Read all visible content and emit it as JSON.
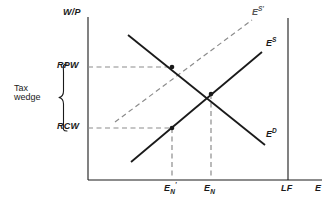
{
  "figure": {
    "type": "economics-diagram",
    "background_color": "#ffffff",
    "line_color": "#1a1a1a",
    "dashed_color": "#8c8c8c"
  },
  "axes": {
    "y_axis_label": "W/P",
    "x_axis_label": "E",
    "origin": {
      "x": 88,
      "y": 180
    },
    "y_top": 17,
    "x_right": 322
  },
  "y_ticks": [
    {
      "label": "RPW",
      "y": 67
    },
    {
      "label": "RCW",
      "y": 128
    }
  ],
  "x_ticks": [
    {
      "label": "E",
      "sub": "N",
      "sup": "'",
      "x": 172
    },
    {
      "label": "E",
      "sub": "N",
      "sup": "",
      "x": 211
    },
    {
      "label": "LF",
      "sub": "",
      "sup": "",
      "x": 288
    }
  ],
  "curves": [
    {
      "name": "labour-demand",
      "label": "E",
      "superscript": "D",
      "style": "solid",
      "x1": 128,
      "y1": 35,
      "x2": 265,
      "y2": 145,
      "label_x": 266,
      "label_y": 135
    },
    {
      "name": "labour-supply",
      "label": "E",
      "superscript": "S",
      "style": "solid",
      "x1": 131,
      "y1": 162,
      "x2": 262,
      "y2": 52,
      "label_x": 266,
      "label_y": 43
    },
    {
      "name": "labour-supply-shifted",
      "label": "E",
      "superscript": "S'",
      "style": "dashed",
      "x1": 115,
      "y1": 122,
      "x2": 252,
      "y2": 20,
      "label_x": 252,
      "label_y": 12
    }
  ],
  "points": [
    {
      "name": "equilibrium-with-tax",
      "x": 172,
      "y": 67
    },
    {
      "name": "equilibrium-no-tax",
      "x": 211,
      "y": 94
    },
    {
      "name": "cost-of-worker",
      "x": 172,
      "y": 128
    }
  ],
  "guides": [
    {
      "name": "rpw-horizontal",
      "orientation": "horizontal",
      "x1": 88,
      "y1": 67,
      "x2": 172,
      "y2": 67
    },
    {
      "name": "rcw-horizontal",
      "orientation": "horizontal",
      "x1": 88,
      "y1": 128,
      "x2": 172,
      "y2": 128
    },
    {
      "name": "en-prime-vertical",
      "orientation": "vertical",
      "x1": 172,
      "y1": 128,
      "x2": 172,
      "y2": 180
    },
    {
      "name": "en-vertical",
      "orientation": "vertical",
      "x1": 211,
      "y1": 94,
      "x2": 211,
      "y2": 180
    }
  ],
  "full_employment_line": {
    "name": "LF",
    "x": 288,
    "y_top": 18,
    "y_bottom": 180
  },
  "tax_wedge": {
    "line1": "Tax",
    "line2": "wedge",
    "brace_top": 64,
    "brace_bottom": 131,
    "brace_x": 62,
    "text_x": 16,
    "text_y": 82
  }
}
